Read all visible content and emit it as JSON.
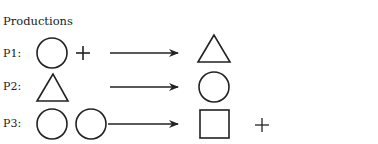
{
  "title": "Productions",
  "productions": [
    {
      "label": "P1:",
      "lhs": [
        "circle",
        "plus"
      ],
      "rhs": [
        "triangle"
      ]
    },
    {
      "label": "P2:",
      "lhs": [
        "triangle"
      ],
      "rhs": [
        "circle"
      ]
    },
    {
      "label": "P3:",
      "lhs": [
        "circle",
        "circle"
      ],
      "rhs": [
        "square",
        "plus"
      ]
    }
  ],
  "colors": {
    "stroke": "#222222",
    "background": "#ffffff"
  }
}
